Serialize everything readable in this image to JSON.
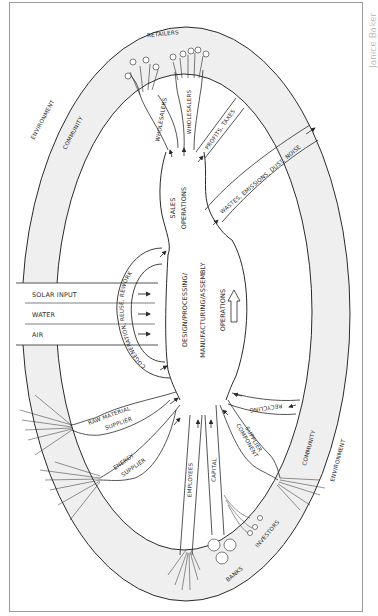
{
  "credit": "Janice Baker",
  "colors": {
    "frame": "#9a9a9a",
    "band": "#efefef",
    "line": "#2a2a2a",
    "background": "#ffffff"
  },
  "rings": {
    "outer_label_left": "ENVIRONMENT",
    "inner_label_left": "COMMUNITY",
    "outer_label_right": "ENVIRONMENT",
    "inner_label_right": "COMMUNITY",
    "top_label": "RETAILERS"
  },
  "outputs": {
    "wholesalers_left": "WHOLESALERS",
    "wholesalers_right": "WHOLESALERS",
    "profits": "PROFITS, TAXES",
    "wastes": "WASTES, EMISSIONS, DUST, NOISE"
  },
  "core": {
    "sales_line1": "SALES",
    "sales_line2": "OPERATIONS",
    "design_line1": "DESIGN/PROCESSING/",
    "design_line2": "MANUFACTURING/ASSEMBLY",
    "operations": "OPERATIONS"
  },
  "loop": {
    "cogeneration": "COGENERATION, REUSE, REWORK",
    "recycling": "RECYCLING"
  },
  "natural_inputs": [
    {
      "label": "SOLAR INPUT"
    },
    {
      "label": "WATER"
    },
    {
      "label": "AIR"
    }
  ],
  "suppliers": {
    "raw_line1": "RAW MATERIAL",
    "raw_line2": "SUPPLIER",
    "energy_line1": "ENERGY",
    "energy_line2": "SUPPLIER",
    "component_line1": "COMPONENT",
    "component_line2": "SUPPLIER"
  },
  "finance": {
    "employees": "EMPLOYEES",
    "capital": "CAPITAL",
    "investors": "INVESTORS",
    "banks": "BANKS"
  }
}
